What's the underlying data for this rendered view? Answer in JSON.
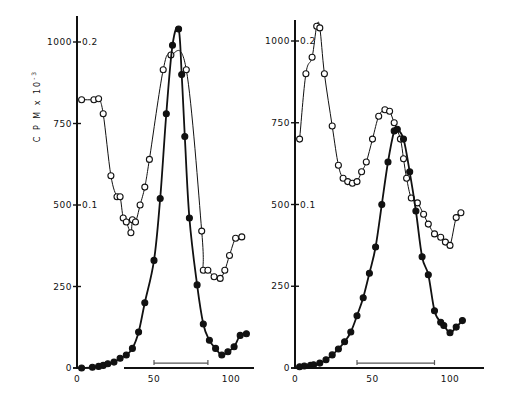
{
  "figure": {
    "ylabel": "C P M  x  10",
    "ylabel_exponent": "-3"
  },
  "chart_data": [
    {
      "type": "line",
      "panel": "left",
      "title": "",
      "xlabel": "",
      "ylabel": "CPM x 10^-3",
      "xlim": [
        0,
        112
      ],
      "ylim": [
        0,
        1060
      ],
      "xticks": [
        0,
        50,
        100
      ],
      "yticks_left": [
        0,
        250,
        500,
        750,
        1000
      ],
      "yticks_right_labels": [
        {
          "at": 500,
          "label": "0.1"
        },
        {
          "at": 1000,
          "label": "0.2"
        }
      ],
      "grid": false,
      "legend": null,
      "bar_annotation": {
        "x_start": 50,
        "x_end": 85,
        "y": 12
      },
      "series": [
        {
          "name": "open circles (absorbance)",
          "marker": "open-circle",
          "x": [
            3,
            11,
            14,
            17,
            22,
            26,
            28,
            30,
            32,
            35,
            36,
            38,
            41,
            44,
            47,
            56,
            61,
            71,
            81,
            82,
            85,
            89,
            93,
            96,
            99,
            103,
            107
          ],
          "y": [
            823,
            823,
            826,
            780,
            590,
            525,
            525,
            460,
            448,
            415,
            455,
            448,
            500,
            555,
            640,
            915,
            960,
            915,
            420,
            300,
            300,
            280,
            275,
            300,
            345,
            398,
            402
          ]
        },
        {
          "name": "filled circles (CPM)",
          "marker": "filled-circle",
          "x": [
            3,
            10,
            14,
            17,
            20,
            24,
            28,
            32,
            36,
            40,
            44,
            50,
            54,
            58,
            62,
            66,
            68,
            70,
            73,
            78,
            82,
            86,
            90,
            94,
            98,
            102,
            106,
            110
          ],
          "y": [
            0,
            2,
            5,
            8,
            13,
            18,
            30,
            40,
            60,
            110,
            200,
            330,
            520,
            780,
            990,
            1040,
            900,
            710,
            460,
            255,
            135,
            85,
            60,
            40,
            50,
            65,
            100,
            105
          ]
        }
      ]
    },
    {
      "type": "line",
      "panel": "right",
      "title": "",
      "xlabel": "",
      "ylabel": "CPM x 10^-3",
      "xlim": [
        0,
        122
      ],
      "ylim": [
        0,
        1060
      ],
      "xticks": [
        0,
        50,
        100
      ],
      "yticks_left": [
        0,
        250,
        500,
        750,
        1000
      ],
      "yticks_right_labels": [
        {
          "at": 500,
          "label": "0.1"
        },
        {
          "at": 1000,
          "label": "0.2"
        }
      ],
      "grid": false,
      "legend": null,
      "bar_annotation": {
        "x_start": 40,
        "x_end": 90,
        "y": 12
      },
      "series": [
        {
          "name": "open circles (absorbance)",
          "marker": "open-circle",
          "x": [
            3,
            7,
            11,
            14,
            16,
            19,
            24,
            28,
            31,
            34,
            37,
            40,
            43,
            46,
            50,
            54,
            58,
            61,
            64,
            68,
            70,
            72,
            75,
            79,
            83,
            86,
            90,
            94,
            97,
            100,
            104,
            107
          ],
          "y": [
            700,
            900,
            950,
            1045,
            1040,
            900,
            740,
            620,
            580,
            570,
            565,
            570,
            600,
            630,
            700,
            770,
            790,
            785,
            750,
            700,
            640,
            580,
            520,
            505,
            470,
            440,
            410,
            400,
            385,
            375,
            460,
            475
          ]
        },
        {
          "name": "filled circles (CPM)",
          "marker": "filled-circle",
          "x": [
            3,
            6,
            10,
            12,
            16,
            20,
            24,
            28,
            32,
            36,
            40,
            44,
            48,
            52,
            56,
            60,
            64,
            66,
            70,
            74,
            78,
            82,
            86,
            90,
            94,
            96,
            100,
            104,
            108
          ],
          "y": [
            4,
            6,
            8,
            10,
            15,
            25,
            40,
            58,
            80,
            110,
            160,
            215,
            290,
            370,
            500,
            630,
            725,
            730,
            700,
            600,
            480,
            340,
            285,
            175,
            140,
            130,
            108,
            125,
            145
          ]
        }
      ]
    }
  ]
}
